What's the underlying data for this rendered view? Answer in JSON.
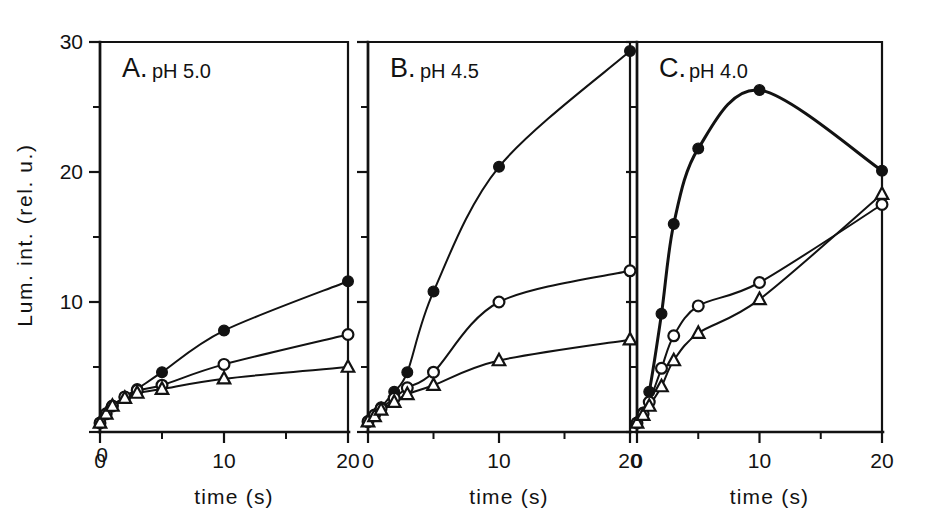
{
  "figure": {
    "background": "#ffffff",
    "ink_color": "#121212",
    "y_axis_label": "Lum. int. (rel. u.)",
    "x_axis_label": "time (s)"
  },
  "axes": {
    "y_ticks_major": [
      "0",
      "10",
      "20",
      "30"
    ],
    "y_tick_values": [
      0,
      10,
      20,
      30
    ],
    "y_minor_values": [
      5,
      15,
      25
    ],
    "ylim": [
      0,
      31.5
    ],
    "x_ticks_major": [
      "0",
      "10",
      "20"
    ],
    "x_tick_values": [
      0,
      10,
      20
    ],
    "x_minor_values": [
      5,
      15
    ],
    "xlim": [
      0,
      21.5
    ]
  },
  "chart_data": {
    "type": "line",
    "title": "",
    "xlabel": "time (s)",
    "ylabel": "Lum. int. (rel. u.)",
    "xlim": [
      0,
      21.5
    ],
    "ylim": [
      0,
      31.5
    ],
    "grid": false,
    "legend_position": "none",
    "panels": [
      {
        "id": "A",
        "letter": "A.",
        "condition": "pH 5.0",
        "series": [
          {
            "name": "filled-circle",
            "marker": "filled-circle",
            "x": [
              0,
              0.5,
              1,
              2,
              3,
              5,
              10,
              20
            ],
            "y": [
              0.7,
              1.4,
              2.0,
              2.7,
              3.3,
              4.6,
              7.8,
              11.6
            ]
          },
          {
            "name": "open-circle",
            "marker": "open-circle",
            "x": [
              0,
              0.5,
              1,
              2,
              3,
              5,
              10,
              20
            ],
            "y": [
              0.7,
              1.4,
              2.0,
              2.7,
              3.2,
              3.6,
              5.2,
              7.5
            ]
          },
          {
            "name": "open-triangle",
            "marker": "open-triangle",
            "x": [
              0,
              0.5,
              1,
              2,
              3,
              5,
              10,
              20
            ],
            "y": [
              0.7,
              1.4,
              2.0,
              2.6,
              3.0,
              3.3,
              4.1,
              5.0
            ]
          }
        ]
      },
      {
        "id": "B",
        "letter": "B.",
        "condition": "pH 4.5",
        "series": [
          {
            "name": "filled-circle",
            "marker": "filled-circle",
            "x": [
              0,
              0.5,
              1,
              2,
              3,
              5,
              10,
              20
            ],
            "y": [
              0.8,
              1.3,
              1.9,
              3.1,
              4.6,
              10.8,
              20.4,
              29.3
            ]
          },
          {
            "name": "open-circle",
            "marker": "open-circle",
            "x": [
              0,
              0.5,
              1,
              2,
              3,
              5,
              10,
              20
            ],
            "y": [
              0.8,
              1.3,
              1.8,
              2.6,
              3.4,
              4.6,
              10.0,
              12.4
            ]
          },
          {
            "name": "open-triangle",
            "marker": "open-triangle",
            "x": [
              0,
              0.5,
              1,
              2,
              3,
              5,
              10,
              20
            ],
            "y": [
              0.8,
              1.2,
              1.7,
              2.3,
              2.9,
              3.6,
              5.5,
              7.1
            ]
          }
        ]
      },
      {
        "id": "C",
        "letter": "C.",
        "condition": "pH 4.0",
        "series": [
          {
            "name": "filled-circle",
            "marker": "filled-circle",
            "x": [
              0,
              0.5,
              1,
              2,
              3,
              5,
              10,
              20
            ],
            "y": [
              0.7,
              1.5,
              3.1,
              9.1,
              16.0,
              21.8,
              26.3,
              20.1
            ]
          },
          {
            "name": "open-circle",
            "marker": "open-circle",
            "x": [
              0,
              0.5,
              1,
              2,
              3,
              5,
              10,
              20
            ],
            "y": [
              0.7,
              1.4,
              2.3,
              4.9,
              7.4,
              9.7,
              11.5,
              17.5
            ]
          },
          {
            "name": "open-triangle",
            "marker": "open-triangle",
            "x": [
              0,
              0.5,
              1,
              2,
              3,
              5,
              10,
              20
            ],
            "y": [
              0.7,
              1.3,
              2.0,
              3.5,
              5.5,
              7.6,
              10.2,
              18.3
            ]
          }
        ]
      }
    ]
  }
}
